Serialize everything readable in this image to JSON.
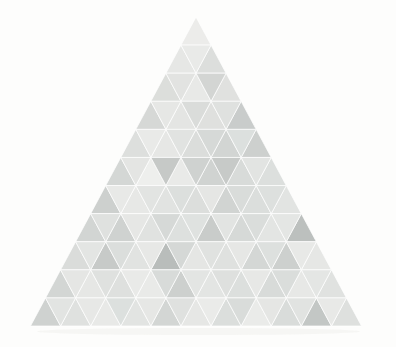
{
  "artwork": {
    "title": "Tessellated Triangle",
    "type": "abstract-geometric-composition",
    "canvas": {
      "width": 396,
      "height": 347,
      "background_color": "#fdfdfc"
    },
    "figure": {
      "shape": "equilateral-triangle",
      "apex": {
        "x": 196,
        "y": 17
      },
      "base_left": {
        "x": 33,
        "y": 326
      },
      "base_right": {
        "x": 364,
        "y": 326
      },
      "base_width": 331,
      "height": 309,
      "rows": 11,
      "row_height": 28.09,
      "tile_count": 121,
      "tile_shape": "triangle",
      "seam_color": "#ffffff",
      "seam_width": 0.7
    },
    "shadow": {
      "visible": true,
      "color": "#f4f4f2",
      "top": 328,
      "height": 7
    },
    "palette": {
      "lightest": "#f4f4f2",
      "light": "#ececeb",
      "mid_light": "#e3e4e2",
      "mid": "#d9dad8",
      "mid_dark": "#cfd1cf",
      "dark": "#c4c7c5",
      "darkest": "#b6b9b7"
    }
  },
  "chart_data": {
    "type": "heatmap",
    "subtitle": "Triangular tile lightness grid",
    "xlabel": "",
    "ylabel": "",
    "legend": [],
    "grid": false,
    "rows": 11,
    "note": "Each row r (1-indexed) holds r upward tiles and r-1 downward tiles. Values are tile fill colors read off the image, left to right.",
    "tiles_up": [
      [
        "#ececea"
      ],
      [
        "#e6e7e5",
        "#dcdedc"
      ],
      [
        "#dcdedb",
        "#e8e9e7",
        "#e0e1df"
      ],
      [
        "#d6d8d6",
        "#e4e5e3",
        "#dfe0de",
        "#c9cccb"
      ],
      [
        "#dddfdd",
        "#e6e7e5",
        "#dbdddb",
        "#d2d5d3",
        "#cdd0ce"
      ],
      [
        "#d4d7d5",
        "#eeefed",
        "#e9eae8",
        "#d0d3d1",
        "#d8dbd9",
        "#dcdfdd"
      ],
      [
        "#cdd0ce",
        "#e7e8e6",
        "#e1e3e1",
        "#dcdedc",
        "#d1d4d2",
        "#dbdedc",
        "#e2e4e2"
      ],
      [
        "#d2d5d3",
        "#cfd2d0",
        "#e0e2e0",
        "#dde0de",
        "#c9ccca",
        "#d6d9d7",
        "#e3e5e3",
        "#bcc0be"
      ],
      [
        "#dadcda",
        "#c7cac8",
        "#e1e3e1",
        "#b9bdbb",
        "#e5e6e4",
        "#dfe1df",
        "#d4d7d5",
        "#cdd0ce",
        "#e6e7e5"
      ],
      [
        "#d3d6d4",
        "#e6e7e5",
        "#dee0de",
        "#e9eae8",
        "#cdd0ce",
        "#e3e5e3",
        "#dcdfdd",
        "#d8dbd9",
        "#e7e8e6",
        "#e0e2e0"
      ],
      [
        "#cfd2d0",
        "#dfe1df",
        "#e8e9e7",
        "#e2e4e2",
        "#d3d6d4",
        "#e6e7e5",
        "#dbdedc",
        "#eaebe9",
        "#d9dcda",
        "#c3c7c5",
        "#dee0de"
      ]
    ],
    "tiles_down": [
      [],
      [
        "#e9eae8"
      ],
      [
        "#e2e3e1",
        "#d3d5d3"
      ],
      [
        "#e6e7e5",
        "#dadcda",
        "#dfe1df"
      ],
      [
        "#e9eae8",
        "#e1e3e1",
        "#d6d9d7",
        "#dce0de"
      ],
      [
        "#e4e5e3",
        "#c6c9c7",
        "#cfd2d0",
        "#c7cac8",
        "#e2e4e2"
      ],
      [
        "#e8e9e7",
        "#e2e4e2",
        "#dcdfdd",
        "#e5e6e4",
        "#d9dcda",
        "#dde0de"
      ],
      [
        "#dfe1df",
        "#e6e7e5",
        "#d6d9d7",
        "#dfe2e0",
        "#e2e4e2",
        "#dadddb",
        "#e4e6e4"
      ],
      [
        "#e3e5e3",
        "#dbdedc",
        "#e7e8e6",
        "#d5d8d6",
        "#e0e2e0",
        "#e6e7e5",
        "#dde0de",
        "#e8e9e7"
      ],
      [
        "#e5e6e4",
        "#dfe1df",
        "#e9eae8",
        "#d8dbd9",
        "#e3e5e3",
        "#dee0de",
        "#e7e8e6",
        "#dadddb",
        "#e4e6e4"
      ],
      [
        "#e2e4e2",
        "#e7e8e6",
        "#dce0de",
        "#e6e7e5",
        "#dfe1df",
        "#eaebe9",
        "#d9dcda",
        "#e5e6e4",
        "#e1e3e1",
        "#e8e9e7"
      ]
    ]
  }
}
